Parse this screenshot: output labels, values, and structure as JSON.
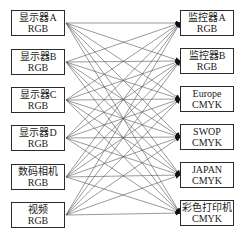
{
  "diagram": {
    "sources": [
      {
        "name": "显示器A",
        "space": "RGB"
      },
      {
        "name": "显示器B",
        "space": "RGB"
      },
      {
        "name": "显示器C",
        "space": "RGB"
      },
      {
        "name": "显示器D",
        "space": "RGB"
      },
      {
        "name": "数码相机",
        "space": "RGB"
      },
      {
        "name": "视频",
        "space": "RGB"
      }
    ],
    "targets": [
      {
        "name": "监控器A",
        "space": "RGB"
      },
      {
        "name": "监控器B",
        "space": "RGB"
      },
      {
        "name": "Europe",
        "space": "CMYK"
      },
      {
        "name": "SWOP",
        "space": "CMYK"
      },
      {
        "name": "JAPAN",
        "space": "CMYK"
      },
      {
        "name": "彩色打印机",
        "space": "CMYK"
      }
    ],
    "connections": "all-to-all",
    "line_color": "#555555",
    "border_color": "#2a2a2a"
  }
}
